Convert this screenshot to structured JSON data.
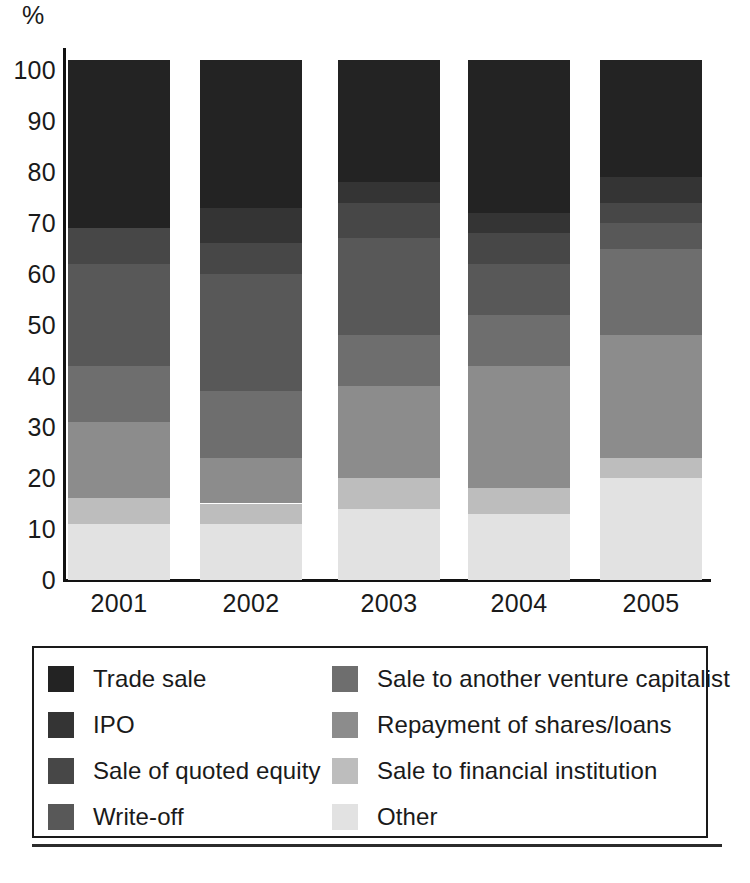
{
  "axis": {
    "y_unit_label": "%",
    "y_ticks": [
      "100",
      "90",
      "80",
      "70",
      "60",
      "50",
      "40",
      "30",
      "20",
      "10",
      "0"
    ],
    "x_ticks": [
      "2001",
      "2002",
      "2003",
      "2004",
      "2005"
    ]
  },
  "legend": {
    "entries": [
      {
        "label": "Trade sale",
        "color": "#232323",
        "icon": "legend-swatch-icon"
      },
      {
        "label": "Sale to another venture capitalist",
        "color": "#6e6e6e",
        "icon": "legend-swatch-icon"
      },
      {
        "label": "IPO",
        "color": "#343434",
        "icon": "legend-swatch-icon"
      },
      {
        "label": "Repayment of shares/loans",
        "color": "#8c8c8c",
        "icon": "legend-swatch-icon"
      },
      {
        "label": "Sale of quoted equity",
        "color": "#474747",
        "icon": "legend-swatch-icon"
      },
      {
        "label": "Sale to financial institution",
        "color": "#bdbdbd",
        "icon": "legend-swatch-icon"
      },
      {
        "label": "Write-off",
        "color": "#585858",
        "icon": "legend-swatch-icon"
      },
      {
        "label": "Other",
        "color": "#e2e2e2",
        "icon": "legend-swatch-icon"
      }
    ]
  },
  "chart_data": {
    "type": "bar",
    "stacked": true,
    "title": "",
    "xlabel": "",
    "ylabel": "%",
    "ylim": [
      0,
      100
    ],
    "grid": false,
    "legend_position": "below",
    "categories": [
      "2001",
      "2002",
      "2003",
      "2004",
      "2005"
    ],
    "series": [
      {
        "name": "Trade sale",
        "color": "#232323",
        "values": [
          33,
          29,
          24,
          30,
          23
        ]
      },
      {
        "name": "IPO",
        "color": "#343434",
        "values": [
          0,
          7,
          4,
          4,
          5
        ]
      },
      {
        "name": "Sale of quoted equity",
        "color": "#474747",
        "values": [
          7,
          6,
          7,
          6,
          4
        ]
      },
      {
        "name": "Write-off",
        "color": "#585858",
        "values": [
          20,
          23,
          19,
          10,
          5
        ]
      },
      {
        "name": "Sale to another venture capitalist",
        "color": "#6e6e6e",
        "values": [
          11,
          13,
          10,
          10,
          17
        ]
      },
      {
        "name": "Repayment of shares/loans",
        "color": "#8c8c8c",
        "values": [
          15,
          9,
          18,
          24,
          24
        ]
      },
      {
        "name": "Sale to financial institution",
        "color": "#bdbdbd",
        "values": [
          5,
          4,
          6,
          5,
          4
        ]
      },
      {
        "name": "Other",
        "color": "#e2e2e2",
        "values": [
          11,
          11,
          14,
          13,
          20
        ]
      }
    ]
  }
}
